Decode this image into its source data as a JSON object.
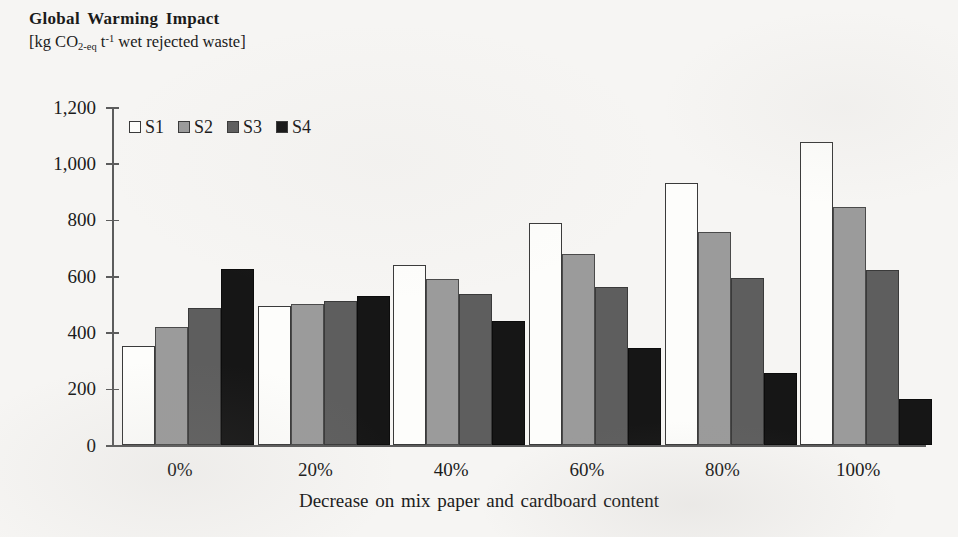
{
  "chart_data": {
    "type": "bar",
    "title": "Global Warming Impact",
    "subtitle_parts": {
      "prefix": "[kg CO",
      "sub1": "2-eq",
      "mid": " t",
      "sup1": "-1",
      "suffix": " wet rejected waste]"
    },
    "subtitle": "[kg CO2-eq t-1 wet rejected waste]",
    "xlabel": "Decrease on mix paper and cardboard content",
    "ylabel": "",
    "ylim": [
      0,
      1200
    ],
    "ytick_step": 200,
    "yticks": [
      {
        "value": 1200,
        "label": "1,200"
      },
      {
        "value": 1000,
        "label": "1,000"
      },
      {
        "value": 800,
        "label": "800"
      },
      {
        "value": 600,
        "label": "600"
      },
      {
        "value": 400,
        "label": "400"
      },
      {
        "value": 200,
        "label": "200"
      },
      {
        "value": 0,
        "label": "0"
      }
    ],
    "categories": [
      "0%",
      "20%",
      "40%",
      "60%",
      "80%",
      "100%"
    ],
    "grid": false,
    "legend_position": "top-left-inside",
    "series": [
      {
        "name": "S1",
        "color": "#fdfdfb",
        "values": [
          350,
          492,
          640,
          788,
          930,
          1075
        ]
      },
      {
        "name": "S2",
        "color": "#9b9b9b",
        "values": [
          420,
          502,
          588,
          678,
          758,
          845
        ]
      },
      {
        "name": "S3",
        "color": "#5e5e5e",
        "values": [
          487,
          512,
          535,
          562,
          592,
          620
        ]
      },
      {
        "name": "S4",
        "color": "#161616",
        "values": [
          625,
          530,
          440,
          345,
          255,
          165
        ]
      }
    ]
  },
  "legend": {
    "items": [
      {
        "label": "S1",
        "swatch": "s1"
      },
      {
        "label": "S2",
        "swatch": "s2"
      },
      {
        "label": "S3",
        "swatch": "s3"
      },
      {
        "label": "S4",
        "swatch": "s4"
      }
    ]
  }
}
